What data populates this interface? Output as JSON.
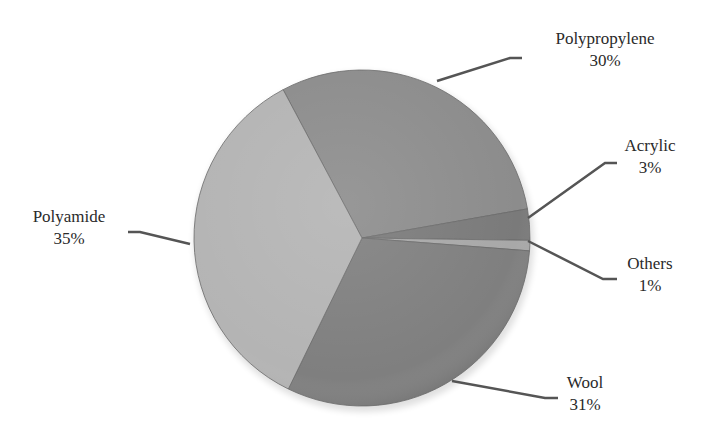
{
  "chart_data": {
    "type": "pie",
    "title": "",
    "start_angle_deg": -118,
    "direction": "clockwise",
    "slices": [
      {
        "label": "Polypropylene",
        "value": 30,
        "display": "30%",
        "color": "#8c8c8c"
      },
      {
        "label": "Acrylic",
        "value": 3,
        "display": "3%",
        "color": "#7a7a7a"
      },
      {
        "label": "Others",
        "value": 1,
        "display": "1%",
        "color": "#a8a8a8"
      },
      {
        "label": "Wool",
        "value": 31,
        "display": "31%",
        "color": "#7f7f7f"
      },
      {
        "label": "Polyamide",
        "value": 35,
        "display": "35%",
        "color": "#b4b4b4"
      }
    ],
    "legend": "none (leader-line labels)",
    "data_labels": "category name and percentage"
  },
  "labels": {
    "polypropylene": {
      "name": "Polypropylene",
      "pct": "30%"
    },
    "acrylic": {
      "name": "Acrylic",
      "pct": "3%"
    },
    "others": {
      "name": "Others",
      "pct": "1%"
    },
    "wool": {
      "name": "Wool",
      "pct": "31%"
    },
    "polyamide": {
      "name": "Polyamide",
      "pct": "35%"
    }
  }
}
